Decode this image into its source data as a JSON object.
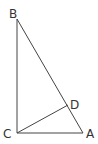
{
  "diagram": {
    "type": "right-triangle-with-altitude",
    "points": {
      "B": {
        "label": "B",
        "x": 17,
        "y": 19
      },
      "C": {
        "label": "C",
        "x": 17,
        "y": 133
      },
      "A": {
        "label": "A",
        "x": 83,
        "y": 133
      },
      "D": {
        "label": "D",
        "x": 68,
        "y": 105
      }
    },
    "segments": [
      "BC",
      "CA",
      "AB",
      "CD"
    ],
    "line_color": "#444444"
  }
}
